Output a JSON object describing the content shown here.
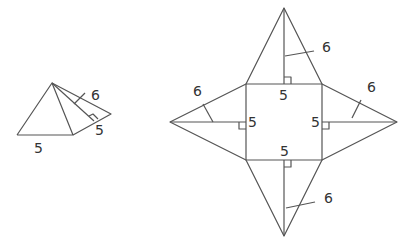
{
  "figure": {
    "line_color": "#555555",
    "text_color": "#333333"
  },
  "pyramid": {
    "base_label": "5",
    "side_base_label": "5",
    "slant_height_label": "6"
  },
  "net": {
    "square_side_top_label": "5",
    "square_side_left_label": "5",
    "square_side_right_label": "5",
    "square_side_bottom_label": "5",
    "top_triangle_height_label": "6",
    "left_triangle_height_label": "6",
    "right_triangle_height_label": "6",
    "bottom_triangle_height_label": "6"
  }
}
